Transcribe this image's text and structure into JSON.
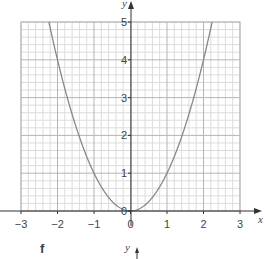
{
  "chart_data": {
    "type": "line",
    "title": "",
    "xlabel": "x",
    "ylabel": "y",
    "xlim": [
      -3,
      3
    ],
    "ylim": [
      0,
      5
    ],
    "grid": true,
    "minor_grid_per_unit": 5,
    "x_ticks": [
      "−3",
      "−2",
      "−1",
      "0",
      "1",
      "2",
      "3"
    ],
    "y_ticks": [
      "0",
      "1",
      "2",
      "3",
      "4",
      "5"
    ],
    "series": [
      {
        "name": "y = x²",
        "x": [
          -2.236,
          -2,
          -1.5,
          -1,
          -0.5,
          0,
          0.5,
          1,
          1.5,
          2,
          2.236
        ],
        "y": [
          5,
          4,
          2.25,
          1,
          0.25,
          0,
          0.25,
          1,
          2.25,
          4,
          5
        ],
        "color": "#888888"
      }
    ],
    "annotations": [
      {
        "text": "f",
        "role": "next-panel-label"
      },
      {
        "text": "y",
        "role": "next-panel-axis-label"
      }
    ],
    "legend": null
  },
  "labels": {
    "x_axis": "x",
    "y_axis": "y",
    "panel_f": "f",
    "panel_f_y_axis": "y"
  }
}
